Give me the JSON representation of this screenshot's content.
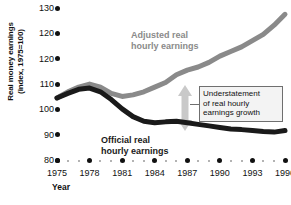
{
  "chart_data": {
    "type": "line",
    "title": "",
    "subtitle": "",
    "xlabel": "Year",
    "ylabel": "Real money earnings\n(index, 1975=100)",
    "ylabel_lines": [
      "Real money earnings",
      "(index, 1975=100)"
    ],
    "grid": false,
    "legend_position": "inline-annotations",
    "xlim": [
      1975,
      1996
    ],
    "ylim": [
      80,
      130
    ],
    "yticks": [
      130,
      120,
      120,
      110,
      100,
      90,
      80
    ],
    "ytick_labels": [
      "130",
      "120",
      "120",
      "110",
      "100",
      "90",
      "80"
    ],
    "xticks": [
      1975,
      1978,
      1981,
      1984,
      1987,
      1990,
      1993,
      1996
    ],
    "xtick_labels": [
      "1975",
      "1978",
      "1981",
      "1984",
      "1987",
      "1990",
      "1993",
      "1996"
    ],
    "x": [
      1975,
      1976,
      1977,
      1978,
      1979,
      1980,
      1981,
      1982,
      1983,
      1984,
      1985,
      1986,
      1987,
      1988,
      1989,
      1990,
      1991,
      1992,
      1993,
      1994,
      1995,
      1996
    ],
    "series": [
      {
        "name": "Adjusted real hourly earnings",
        "color": "#8a8a8a",
        "values": [
          100.0,
          102.0,
          103.5,
          104.5,
          103.5,
          101.5,
          100.5,
          101.0,
          102.0,
          103.5,
          105.0,
          107.5,
          109.0,
          110.0,
          111.5,
          113.5,
          115.0,
          116.5,
          118.5,
          120.5,
          123.5,
          127.0
        ]
      },
      {
        "name": "Official real hourly earnings",
        "color": "#1a1a1a",
        "values": [
          100.0,
          101.5,
          102.8,
          103.2,
          102.0,
          99.5,
          96.5,
          94.0,
          92.5,
          92.0,
          92.3,
          92.5,
          92.0,
          91.5,
          91.0,
          90.5,
          90.0,
          89.8,
          89.5,
          89.2,
          89.0,
          89.5
        ]
      }
    ],
    "annotations": [
      {
        "name": "adjusted-series-label",
        "text": "Adjusted real\nhourly earnings",
        "lines": [
          "Adjusted real",
          "hourly earnings"
        ],
        "color": "#8a8a8a"
      },
      {
        "name": "official-series-label",
        "text": "Official real\nhourly earnings",
        "lines": [
          "Official real",
          "hourly earnings"
        ],
        "color": "#1a1a1a"
      },
      {
        "name": "understatement-callout",
        "text": "Understatement\nof real hourly\nearnings growth",
        "lines": [
          "Understatement",
          "of real hourly",
          "earnings growth"
        ],
        "color": "#111111",
        "has_arrow": true,
        "arrow_direction": "double-vertical",
        "arrow_color": "#c9c9c9"
      }
    ],
    "colors": {
      "adjusted": "#8a8a8a",
      "official": "#1a1a1a",
      "arrow": "#c9c9c9",
      "axis": "#111111",
      "minor_dot": "#9a9a9a",
      "callout_border": "#6f6f6f",
      "callout_fill": "#f3f3f3",
      "background": "#ffffff"
    }
  },
  "axes": {
    "y_title_line1": "Real money earnings",
    "y_title_line2": "(index, 1975=100)",
    "x_title": "Year"
  },
  "labels": {
    "adjusted_line1": "Adjusted real",
    "adjusted_line2": "hourly earnings",
    "official_line1": "Official real",
    "official_line2": "hourly earnings",
    "callout_line1": "Understatement",
    "callout_line2": "of real hourly",
    "callout_line3": "earnings growth"
  }
}
